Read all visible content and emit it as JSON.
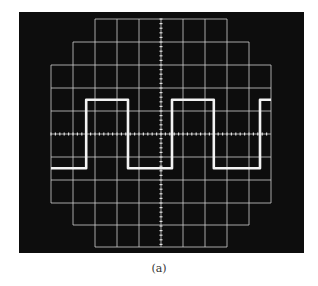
{
  "caption": "(a)",
  "colors": {
    "screen": "#0d0d0d",
    "grid": "#cfcfcf",
    "trace": "#f2f2f2",
    "background": "#ffffff"
  },
  "chart_data": {
    "type": "line",
    "xlabel": "",
    "ylabel": "",
    "grid": true,
    "graticule": {
      "vertical_divisions": 10,
      "horizontal_divisions": 10,
      "center_axes_with_minor_ticks": true
    },
    "series": [
      {
        "name": "square wave",
        "x_div": [
          0,
          1.6,
          1.6,
          3.5,
          3.5,
          5.5,
          5.5,
          7.4,
          7.4,
          9.5,
          9.5,
          10
        ],
        "y_div": [
          -1.5,
          -1.5,
          1.5,
          1.5,
          -1.5,
          -1.5,
          1.5,
          1.5,
          -1.5,
          -1.5,
          1.5,
          1.5
        ]
      }
    ],
    "xlim": [
      0,
      10
    ],
    "ylim": [
      -5,
      5
    ]
  }
}
